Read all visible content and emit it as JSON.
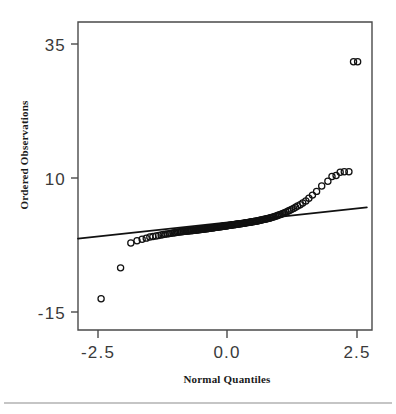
{
  "chart_data": {
    "type": "scatter",
    "title": "",
    "xlabel": "Normal Quantiles",
    "ylabel": "Ordered Observations",
    "xlim": [
      -2.95,
      2.78
    ],
    "ylim": [
      -19.5,
      38.5
    ],
    "xticks": [
      -2.5,
      0.0,
      2.5
    ],
    "xticklabels": [
      "-2.5",
      "0.0",
      "2.5"
    ],
    "yticks": [
      35,
      10,
      -15
    ],
    "yticklabels": [
      "35",
      "10",
      "-15"
    ],
    "grid": false,
    "legend": null,
    "marker": "open-circle",
    "series": [
      {
        "name": "Ordered Observations",
        "x": [
          -2.5,
          -2.12,
          -1.92,
          -1.8,
          -1.7,
          -1.62,
          -1.55,
          -1.49,
          -1.43,
          -1.38,
          -1.33,
          -1.29,
          -1.25,
          -1.21,
          -1.17,
          -1.14,
          -1.1,
          -1.07,
          -1.04,
          -1.01,
          -0.98,
          -0.95,
          -0.93,
          -0.9,
          -0.87,
          -0.85,
          -0.82,
          -0.8,
          -0.78,
          -0.75,
          -0.73,
          -0.71,
          -0.69,
          -0.66,
          -0.64,
          -0.62,
          -0.6,
          -0.58,
          -0.56,
          -0.54,
          -0.52,
          -0.5,
          -0.48,
          -0.46,
          -0.44,
          -0.42,
          -0.41,
          -0.39,
          -0.37,
          -0.35,
          -0.33,
          -0.31,
          -0.3,
          -0.28,
          -0.26,
          -0.24,
          -0.23,
          -0.21,
          -0.19,
          -0.17,
          -0.16,
          -0.14,
          -0.12,
          -0.11,
          -0.09,
          -0.07,
          -0.05,
          -0.04,
          -0.02,
          0.0,
          0.02,
          0.04,
          0.05,
          0.07,
          0.09,
          0.11,
          0.12,
          0.14,
          0.16,
          0.17,
          0.19,
          0.21,
          0.23,
          0.24,
          0.26,
          0.28,
          0.3,
          0.31,
          0.33,
          0.35,
          0.37,
          0.39,
          0.41,
          0.42,
          0.44,
          0.46,
          0.48,
          0.5,
          0.52,
          0.54,
          0.56,
          0.58,
          0.6,
          0.62,
          0.64,
          0.66,
          0.69,
          0.71,
          0.73,
          0.75,
          0.78,
          0.8,
          0.82,
          0.85,
          0.87,
          0.9,
          0.93,
          0.95,
          0.98,
          1.01,
          1.04,
          1.07,
          1.1,
          1.14,
          1.17,
          1.21,
          1.25,
          1.29,
          1.33,
          1.38,
          1.43,
          1.49,
          1.55,
          1.62,
          1.7,
          1.8,
          1.92,
          2.0,
          2.08,
          2.16,
          2.24,
          2.33,
          2.42,
          2.5
        ],
        "y": [
          -13.6,
          -7.8,
          -3.1,
          -2.7,
          -2.4,
          -2.2,
          -2.0,
          -1.9,
          -1.8,
          -1.7,
          -1.6,
          -1.5,
          -1.45,
          -1.4,
          -1.35,
          -1.3,
          -1.25,
          -1.2,
          -1.15,
          -1.1,
          -1.05,
          -1.0,
          -0.98,
          -0.95,
          -0.92,
          -0.9,
          -0.87,
          -0.85,
          -0.82,
          -0.8,
          -0.77,
          -0.75,
          -0.72,
          -0.7,
          -0.67,
          -0.65,
          -0.62,
          -0.6,
          -0.57,
          -0.55,
          -0.52,
          -0.5,
          -0.47,
          -0.45,
          -0.42,
          -0.4,
          -0.37,
          -0.35,
          -0.32,
          -0.3,
          -0.27,
          -0.25,
          -0.22,
          -0.2,
          -0.17,
          -0.15,
          -0.12,
          -0.1,
          -0.07,
          -0.05,
          -0.02,
          0.0,
          0.03,
          0.05,
          0.08,
          0.1,
          0.13,
          0.15,
          0.18,
          0.2,
          0.23,
          0.25,
          0.28,
          0.3,
          0.33,
          0.35,
          0.38,
          0.4,
          0.43,
          0.45,
          0.48,
          0.5,
          0.53,
          0.55,
          0.58,
          0.6,
          0.63,
          0.66,
          0.69,
          0.72,
          0.75,
          0.78,
          0.81,
          0.84,
          0.87,
          0.9,
          0.94,
          0.97,
          1.0,
          1.04,
          1.08,
          1.12,
          1.16,
          1.2,
          1.24,
          1.29,
          1.34,
          1.39,
          1.44,
          1.5,
          1.56,
          1.62,
          1.69,
          1.76,
          1.84,
          1.92,
          2.01,
          2.1,
          2.2,
          2.3,
          2.42,
          2.55,
          2.7,
          2.85,
          3.0,
          3.2,
          3.4,
          3.6,
          3.85,
          4.1,
          4.4,
          4.8,
          5.3,
          5.9,
          6.6,
          7.6,
          8.5,
          9.4,
          9.6,
          10.2,
          10.3,
          10.3,
          31.0,
          31.0
        ]
      }
    ],
    "reference_line": {
      "x": [
        -2.95,
        2.68
      ],
      "y": [
        -2.3,
        3.6
      ],
      "description": "fitted normal reference line"
    },
    "annotations": []
  },
  "axes": {
    "y_title": "Ordered Observations",
    "x_title": "Normal Quantiles",
    "y_tick_labels": [
      "35",
      "10",
      "-15"
    ],
    "x_tick_labels": [
      "-2.5",
      "0.0",
      "2.5"
    ]
  },
  "colors": {
    "marker_stroke": "#111111",
    "reference_line": "#111111",
    "frame": "#4a4a4a",
    "tick_label": "#3a3a3a",
    "axis_title": "#1a1a1a",
    "background": "#ffffff",
    "footer_rule": "#8c8c8c"
  }
}
